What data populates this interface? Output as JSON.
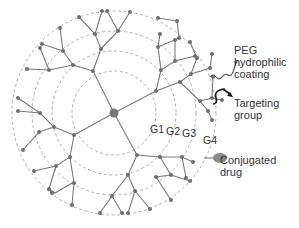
{
  "diagram": {
    "center": {
      "x": 114,
      "y": 113
    },
    "rings": [
      {
        "name": "G1",
        "radius": 42
      },
      {
        "name": "G2",
        "radius": 62
      },
      {
        "name": "G3",
        "radius": 82
      },
      {
        "name": "G4",
        "radius": 102
      }
    ],
    "generation_labels": [
      "G1",
      "G2",
      "G3",
      "G4"
    ],
    "annotations": {
      "peg": {
        "line1": "PEG",
        "line2": "hydrophilic",
        "line3": "coating"
      },
      "targeting": {
        "line1": "Targeting",
        "line2": "group"
      },
      "drug": {
        "line1": "Conjugated",
        "line2": "drug"
      }
    },
    "colors": {
      "line": "#7a7a7a",
      "node": "#6e6e6e",
      "ring": "#9a9a9a",
      "core": "#777777",
      "drug": "#8a8a8a",
      "text": "#333333"
    }
  }
}
